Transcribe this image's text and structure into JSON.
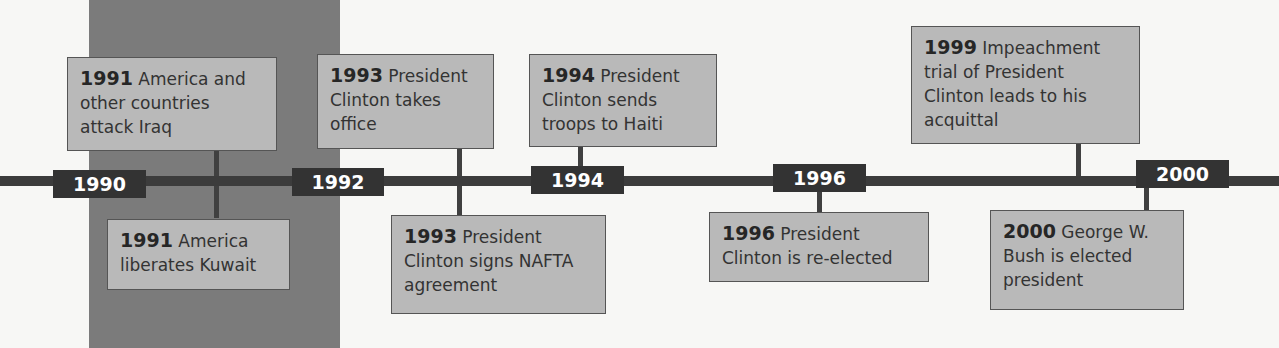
{
  "timeline": {
    "years": [
      "1990",
      "1992",
      "1994",
      "1996",
      "2000"
    ],
    "events_above": [
      {
        "year": "1991",
        "text": "America and other countries attack Iraq"
      },
      {
        "year": "1993",
        "text": "President Clinton takes office"
      },
      {
        "year": "1994",
        "text": "President Clinton sends troops to Haiti"
      },
      {
        "year": "1999",
        "text": "Impeachment trial of President Clinton leads to his acquittal"
      }
    ],
    "events_below": [
      {
        "year": "1991",
        "text": "America liberates Kuwait"
      },
      {
        "year": "1993",
        "text": "President Clinton signs NAFTA agreement"
      },
      {
        "year": "1996",
        "text": "President Clinton is re-elected"
      },
      {
        "year": "2000",
        "text": "George W. Bush is elected president"
      }
    ],
    "colors": {
      "axis": "#3c3c3c",
      "box": "#b9b9b9",
      "shade": "#7b7b7b"
    }
  }
}
